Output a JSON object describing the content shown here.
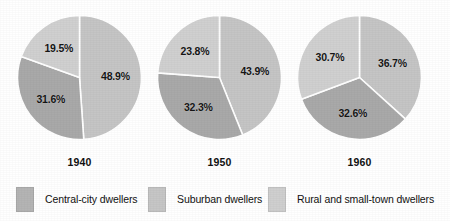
{
  "chart_data": {
    "type": "pie",
    "title": "",
    "subtitle": "",
    "xlabel": "",
    "ylabel": "",
    "grid": false,
    "legend_position": "bottom",
    "value_suffix": "%",
    "start_angle_deg": 0,
    "direction": "clockwise",
    "separator_color": "#ffffff",
    "background_color": "#ffffff",
    "categories": [
      "Central-city dwellers",
      "Suburban dwellers",
      "Rural and small-town dwellers"
    ],
    "colors": [
      "#c5c5c5",
      "#a9a9a9",
      "#d0d0d0"
    ],
    "charts": [
      {
        "name": "1940",
        "year_label": "1940",
        "slices": [
          {
            "category": "Central-city dwellers",
            "value": 48.9,
            "label": "48.9%",
            "color": "#c5c5c5"
          },
          {
            "category": "Suburban dwellers",
            "value": 31.6,
            "label": "31.6%",
            "color": "#a9a9a9"
          },
          {
            "category": "Rural and small-town dwellers",
            "value": 19.5,
            "label": "19.5%",
            "color": "#d0d0d0"
          }
        ]
      },
      {
        "name": "1950",
        "year_label": "1950",
        "slices": [
          {
            "category": "Central-city dwellers",
            "value": 43.9,
            "label": "43.9%",
            "color": "#c5c5c5"
          },
          {
            "category": "Suburban dwellers",
            "value": 32.3,
            "label": "32.3%",
            "color": "#a9a9a9"
          },
          {
            "category": "Rural and small-town dwellers",
            "value": 23.8,
            "label": "23.8%",
            "color": "#d0d0d0"
          }
        ]
      },
      {
        "name": "1960",
        "year_label": "1960",
        "slices": [
          {
            "category": "Central-city dwellers",
            "value": 36.7,
            "label": "36.7%",
            "color": "#c5c5c5"
          },
          {
            "category": "Suburban dwellers",
            "value": 32.6,
            "label": "32.6%",
            "color": "#a9a9a9"
          },
          {
            "category": "Rural and small-town dwellers",
            "value": 30.7,
            "label": "30.7%",
            "color": "#d0d0d0"
          }
        ]
      }
    ],
    "legend": [
      {
        "label": "Central-city dwellers",
        "color": "#b4b4b4"
      },
      {
        "label": "Suburban dwellers",
        "color": "#c6c6c6"
      },
      {
        "label": "Rural and small-town dwellers",
        "color": "#cfcfcf"
      }
    ]
  }
}
